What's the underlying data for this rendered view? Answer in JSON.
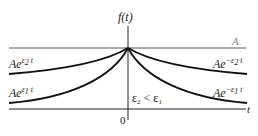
{
  "diagram": {
    "y_axis_label": "f(t)",
    "x_axis_label": "t",
    "origin_label": "0",
    "level_label": "A",
    "condition": {
      "e2": "ε",
      "sub2": "2",
      "lt": " < ",
      "e1": "ε",
      "sub1": "1"
    },
    "curves": [
      {
        "label_base": "Ae",
        "label_exp": "ε",
        "label_sub": "2",
        "label_t": " t",
        "side": "left"
      },
      {
        "label_base": "Ae",
        "label_exp": "ε",
        "label_sub": "1",
        "label_t": " t",
        "side": "left"
      },
      {
        "label_base": "Ae",
        "label_exp": "−ε",
        "label_sub": "2",
        "label_t": " t",
        "side": "right"
      },
      {
        "label_base": "Ae",
        "label_exp": "−ε",
        "label_sub": "1",
        "label_t": " t",
        "side": "right"
      }
    ],
    "colors": {
      "curve": "#111111",
      "axis": "#222222",
      "level_line": "#555555",
      "level_label": "#888888"
    }
  }
}
